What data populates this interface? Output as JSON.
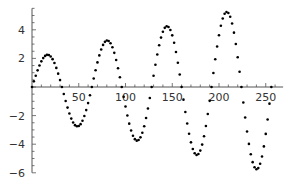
{
  "chart_data": {
    "type": "scatter",
    "title": "",
    "xlabel": "",
    "ylabel": "",
    "xlim": [
      0,
      260
    ],
    "ylim": [
      -6,
      5.5
    ],
    "grid": false,
    "legend": null,
    "x_ticks": [
      50,
      100,
      150,
      200,
      250
    ],
    "y_ticks": [
      -6,
      -4,
      -2,
      2,
      4
    ],
    "function_description": "y = (2 + x/64) * sin(2*pi*x/64), sampled every 2 units from 0 to 256",
    "sample_step": 2,
    "x_max": 256,
    "key_points": [
      {
        "x": 16,
        "y": 2.25,
        "label": "peak"
      },
      {
        "x": 48,
        "y": -2.75,
        "label": "trough"
      },
      {
        "x": 80,
        "y": 3.25,
        "label": "peak"
      },
      {
        "x": 112,
        "y": -3.75,
        "label": "trough"
      },
      {
        "x": 144,
        "y": 4.25,
        "label": "peak"
      },
      {
        "x": 176,
        "y": -4.75,
        "label": "trough"
      },
      {
        "x": 208,
        "y": 5.25,
        "label": "peak"
      },
      {
        "x": 240,
        "y": -5.75,
        "label": "trough"
      }
    ],
    "point_color": "#000000"
  }
}
